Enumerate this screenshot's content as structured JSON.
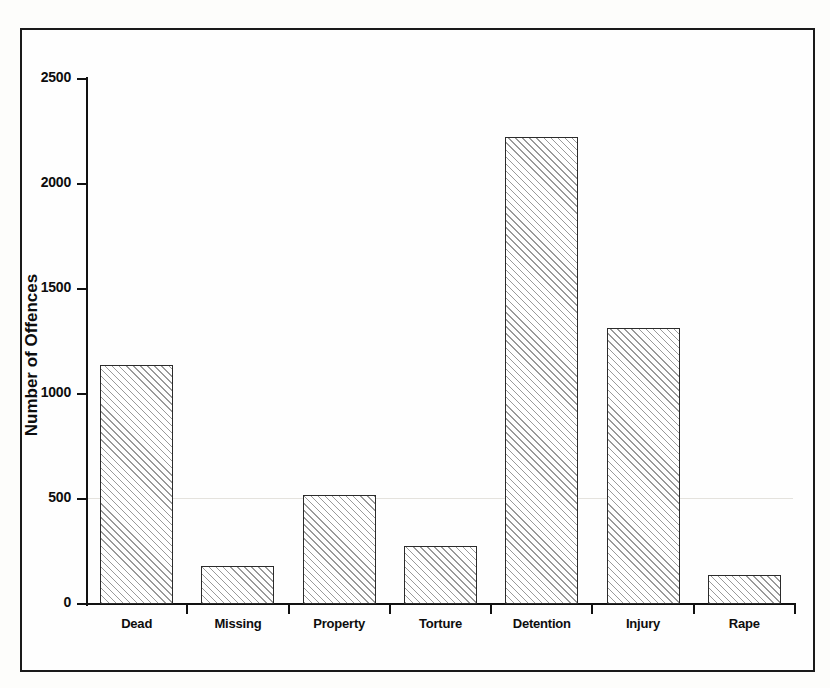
{
  "figure": {
    "background_color": "#fefefe",
    "frame_color": "#1a1a1a"
  },
  "chart_data": {
    "type": "bar",
    "title": "",
    "xlabel": "",
    "ylabel": "Number of Offences",
    "categories": [
      "Dead",
      "Missing",
      "Property",
      "Torture",
      "Detention",
      "Injury",
      "Rape"
    ],
    "values": [
      1140,
      180,
      520,
      275,
      2225,
      1315,
      140
    ],
    "ylim": [
      0,
      2500
    ],
    "yticks": [
      0,
      500,
      1000,
      1500,
      2000,
      2500
    ],
    "ytick_labels": [
      "0",
      "500",
      "1000",
      "1500",
      "2000",
      "2500"
    ],
    "grid": false,
    "legend": null,
    "bar_style": {
      "fill": "hatched-diagonal",
      "hatch_color": "#9a9a9a",
      "edge_color": "#2b2b2b",
      "face_color": "#ffffff"
    }
  }
}
